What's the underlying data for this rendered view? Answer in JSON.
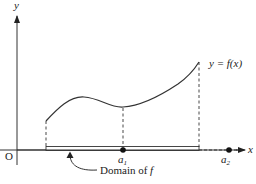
{
  "diagram": {
    "axes": {
      "x_label": "x",
      "y_label": "y",
      "origin_label": "O"
    },
    "curve": {
      "label": "y = f(x)",
      "description": "smooth curve with local max then local min at a1, rising to right endpoint"
    },
    "points": [
      {
        "name": "a",
        "subscript": "1",
        "on_domain": true
      },
      {
        "name": "a",
        "subscript": "2",
        "on_domain": false
      }
    ],
    "domain_label_prefix": "Domain of ",
    "domain_label_var": "f",
    "colors": {
      "line": "#333333",
      "domain_bar_fill": "#ffffff",
      "text": "#222222",
      "background": "#ffffff"
    }
  }
}
